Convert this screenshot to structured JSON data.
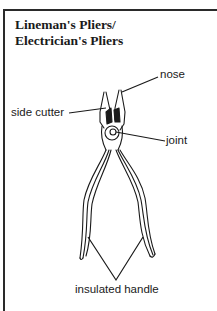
{
  "figure": {
    "title_line1": "Lineman's Pliers/",
    "title_line2": "Electrician's Pliers",
    "labels": {
      "nose": "nose",
      "side_cutter": "side cutter",
      "joint": "joint",
      "insulated_handle": "insulated handle"
    }
  }
}
